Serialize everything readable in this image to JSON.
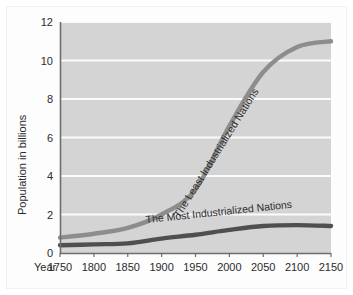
{
  "chart_data": {
    "type": "line",
    "title": "",
    "xlabel": "Year",
    "ylabel": "Population in billions",
    "xlim": [
      1750,
      2150
    ],
    "ylim": [
      0,
      12
    ],
    "grid": true,
    "legend_position": "inline-labels",
    "xticks": [
      "1750",
      "1800",
      "1850",
      "1900",
      "1950",
      "2000",
      "2050",
      "2100",
      "2150"
    ],
    "yticks": [
      "0",
      "2",
      "4",
      "6",
      "8",
      "10",
      "12"
    ],
    "x": [
      1750,
      1800,
      1850,
      1900,
      1950,
      2000,
      2050,
      2100,
      2150
    ],
    "series": [
      {
        "name": "The Least Industrialized Nations",
        "color": "#8d8d8d",
        "values": [
          0.8,
          1.0,
          1.3,
          2.0,
          3.3,
          6.6,
          9.4,
          10.7,
          11.0
        ]
      },
      {
        "name": "The Most Industrialized Nations",
        "color": "#4f4f4f",
        "values": [
          0.4,
          0.45,
          0.5,
          0.75,
          0.95,
          1.2,
          1.4,
          1.45,
          1.4
        ]
      }
    ],
    "annotations": [
      {
        "text": "The Least Industrialized Nations",
        "anchor_year": 1985,
        "anchor_value": 5.1,
        "rotation": -58
      },
      {
        "text": "The Most Industrialized Nations",
        "anchor_year": 1985,
        "anchor_value": 1.95,
        "rotation": -6
      }
    ],
    "colors": {
      "plot_background": "#d4d4d4",
      "gridline": "#fbfbfb",
      "axis": "#6e6e6e",
      "text": "#2b2b2b",
      "page_background": "#ffffff"
    }
  },
  "axis": {
    "x_title": "Year",
    "y_title": "Population in billions"
  }
}
